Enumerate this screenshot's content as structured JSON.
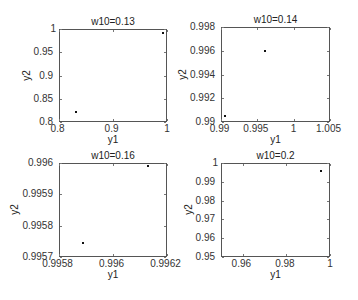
{
  "chart_data": [
    {
      "type": "scatter",
      "title": "w10=0.13",
      "xlabel": "y1",
      "ylabel": "y2",
      "xlim": [
        0.8,
        1
      ],
      "ylim": [
        0.8,
        1
      ],
      "xticks": [
        "0.8",
        "0.9",
        "1"
      ],
      "yticks": [
        "0.8",
        "0.85",
        "0.9",
        "0.95",
        "1"
      ],
      "grid": false,
      "points": [
        [
          0.831,
          0.822
        ],
        [
          0.993,
          0.991
        ]
      ]
    },
    {
      "type": "scatter",
      "title": "w10=0.14",
      "xlabel": "y1",
      "ylabel": "y2",
      "xlim": [
        0.99,
        1.005
      ],
      "ylim": [
        0.99,
        0.998
      ],
      "xticks": [
        "0.99",
        "0.995",
        "1",
        "1.005"
      ],
      "yticks": [
        "0.99",
        "0.992",
        "0.994",
        "0.996",
        "0.998"
      ],
      "grid": false,
      "points": [
        [
          0.9906,
          0.9905
        ],
        [
          0.9961,
          0.996
        ]
      ]
    },
    {
      "type": "scatter",
      "title": "w10=0.16",
      "xlabel": "y1",
      "ylabel": "y2",
      "xlim": [
        0.9958,
        0.9962
      ],
      "ylim": [
        0.9957,
        0.996
      ],
      "xticks": [
        "0.9958",
        "0.996",
        "0.9962"
      ],
      "yticks": [
        "0.9957",
        "0.9958",
        "0.9959",
        "0.996"
      ],
      "grid": false,
      "points": [
        [
          0.99589,
          0.995745
        ],
        [
          0.99613,
          0.99599
        ]
      ]
    },
    {
      "type": "scatter",
      "title": "w10=0.2",
      "xlabel": "y1",
      "ylabel": "y2",
      "xlim": [
        0.95,
        1
      ],
      "ylim": [
        0.95,
        1
      ],
      "xticks": [
        "0.96",
        "0.98",
        "1"
      ],
      "yticks": [
        "0.95",
        "0.96",
        "0.97",
        "0.98",
        "0.99",
        "1"
      ],
      "grid": false,
      "points": [
        [
          0.996,
          0.9957
        ]
      ]
    }
  ],
  "layout": {
    "axes": [
      {
        "left": 59,
        "top": 29,
        "width": 108,
        "height": 93
      },
      {
        "left": 221,
        "top": 27,
        "width": 109,
        "height": 95
      },
      {
        "left": 59,
        "top": 163,
        "width": 108,
        "height": 94
      },
      {
        "left": 221,
        "top": 163,
        "width": 109,
        "height": 94
      }
    ],
    "xtick_values": [
      [
        0.8,
        0.9,
        1
      ],
      [
        0.99,
        0.995,
        1,
        1.005
      ],
      [
        0.9958,
        0.996,
        0.9962
      ],
      [
        0.96,
        0.98,
        1
      ]
    ],
    "ytick_values": [
      [
        0.8,
        0.85,
        0.9,
        0.95,
        1
      ],
      [
        0.99,
        0.992,
        0.994,
        0.996,
        0.998
      ],
      [
        0.9957,
        0.9958,
        0.9959,
        0.996
      ],
      [
        0.95,
        0.96,
        0.97,
        0.98,
        0.99,
        1
      ]
    ]
  }
}
